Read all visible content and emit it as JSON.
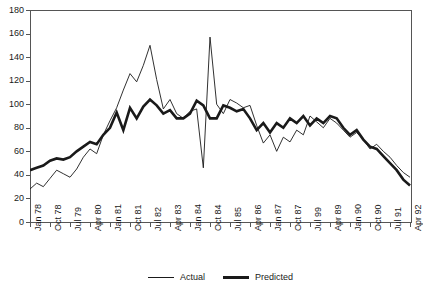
{
  "chart_data": {
    "type": "line",
    "title": "",
    "xlabel": "",
    "ylabel": "",
    "ylim": [
      0,
      180
    ],
    "ytick_step": 20,
    "yticks": [
      0,
      20,
      40,
      60,
      80,
      100,
      120,
      140,
      160,
      180
    ],
    "grid": false,
    "legend_position": "bottom-center",
    "x_tick_labels": [
      "Jan 78",
      "Oct 78",
      "Jul 79",
      "Apr 80",
      "Jan 81",
      "Oct 81",
      "Jul 82",
      "Apr 83",
      "Jan 84",
      "Oct 84",
      "Jul 85",
      "Apr 86",
      "Jan 87",
      "Oct 87",
      "Jul 99",
      "Apr 89",
      "Jan 90",
      "Oct 90",
      "Jul 91",
      "Apr 92"
    ],
    "x_label_interval_quarters": 3,
    "x": [
      "Jan 78",
      "Apr 78",
      "Jul 78",
      "Oct 78",
      "Jan 79",
      "Apr 79",
      "Jul 79",
      "Oct 79",
      "Jan 80",
      "Apr 80",
      "Jul 80",
      "Oct 80",
      "Jan 81",
      "Apr 81",
      "Jul 81",
      "Oct 81",
      "Jan 82",
      "Apr 82",
      "Jul 82",
      "Oct 82",
      "Jan 83",
      "Apr 83",
      "Jul 83",
      "Oct 83",
      "Jan 84",
      "Apr 84",
      "Jul 84",
      "Oct 84",
      "Jan 85",
      "Apr 85",
      "Jul 85",
      "Oct 85",
      "Jan 86",
      "Apr 86",
      "Jul 86",
      "Oct 86",
      "Jan 87",
      "Apr 87",
      "Jul 87",
      "Oct 87",
      "Jan 88",
      "Apr 88",
      "Jul 99",
      "Oct 88",
      "Jan 89",
      "Apr 89",
      "Jul 89",
      "Oct 89",
      "Jan 90",
      "Apr 90",
      "Jul 90",
      "Oct 90",
      "Jan 91",
      "Apr 91",
      "Jul 91",
      "Oct 91",
      "Jan 92",
      "Apr 92"
    ],
    "series": [
      {
        "name": "Actual",
        "style": "thin",
        "color": "#1a1a1a",
        "values": [
          28,
          33,
          30,
          37,
          44,
          41,
          38,
          45,
          55,
          62,
          58,
          74,
          86,
          97,
          112,
          126,
          119,
          133,
          150,
          121,
          96,
          104,
          92,
          88,
          94,
          96,
          46,
          157,
          100,
          92,
          104,
          101,
          97,
          99,
          82,
          67,
          74,
          60,
          72,
          68,
          78,
          74,
          90,
          85,
          80,
          88,
          84,
          78,
          72,
          76,
          70,
          62,
          66,
          60,
          55,
          48,
          42,
          38
        ]
      },
      {
        "name": "Predicted",
        "style": "thick",
        "color": "#1a1a1a",
        "values": [
          44,
          46,
          48,
          52,
          54,
          53,
          55,
          60,
          64,
          68,
          66,
          74,
          80,
          93,
          78,
          97,
          88,
          98,
          104,
          99,
          92,
          95,
          88,
          88,
          92,
          103,
          99,
          88,
          88,
          99,
          97,
          94,
          96,
          88,
          78,
          84,
          76,
          84,
          80,
          88,
          84,
          90,
          82,
          88,
          84,
          90,
          88,
          80,
          74,
          78,
          70,
          64,
          62,
          56,
          50,
          44,
          36,
          31
        ]
      }
    ],
    "legend": [
      {
        "label": "Actual",
        "style": "thin"
      },
      {
        "label": "Predicted",
        "style": "thick"
      }
    ]
  }
}
